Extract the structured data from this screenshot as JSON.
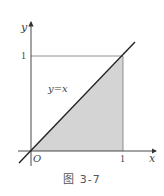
{
  "figure": {
    "caption": "图 3-7",
    "axis_x_label": "x",
    "axis_y_label": "y",
    "origin_label": "O",
    "x_tick_label": "1",
    "y_tick_label": "1",
    "line_label": "y=x",
    "colors": {
      "axis": "#333333",
      "line": "#222222",
      "shade": "#d4d4d4",
      "guide": "#777777"
    }
  }
}
